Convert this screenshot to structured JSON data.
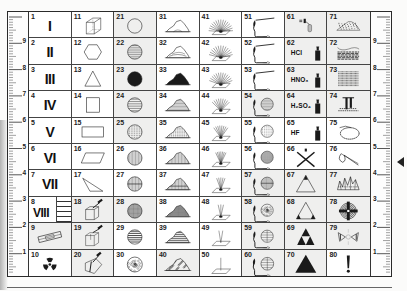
{
  "card": {
    "ruler_left_labels": [
      "9",
      "8",
      "7",
      "6",
      "5",
      "4",
      "3",
      "2",
      "1"
    ],
    "ruler_right_labels": [
      "9",
      "8",
      "7",
      "6",
      "5",
      "4",
      "3",
      "2",
      "1"
    ],
    "pointer": "triangle-pointer-left",
    "cells": [
      {
        "n": "1",
        "roman": "I",
        "icon": "roman-numeral"
      },
      {
        "n": "2",
        "roman": "II",
        "icon": "roman-numeral"
      },
      {
        "n": "3",
        "roman": "III",
        "icon": "roman-numeral"
      },
      {
        "n": "4",
        "roman": "IV",
        "icon": "roman-numeral"
      },
      {
        "n": "5",
        "roman": "V",
        "icon": "roman-numeral"
      },
      {
        "n": "6",
        "roman": "VI",
        "icon": "roman-numeral"
      },
      {
        "n": "7",
        "roman": "VII",
        "icon": "roman-numeral"
      },
      {
        "n": "8",
        "roman": "VIII",
        "icon": "roman-numeral-with-ladder"
      },
      {
        "n": "9",
        "icon": "rock-saw-icon"
      },
      {
        "n": "10",
        "icon": "radioactive-icon"
      },
      {
        "n": "11",
        "icon": "cube-icon"
      },
      {
        "n": "12",
        "icon": "hexagon-icon"
      },
      {
        "n": "13",
        "icon": "triangle-icon"
      },
      {
        "n": "14",
        "icon": "square-icon"
      },
      {
        "n": "15",
        "icon": "rectangle-icon"
      },
      {
        "n": "16",
        "icon": "parallelogram-icon"
      },
      {
        "n": "17",
        "icon": "scalene-triangle-icon"
      },
      {
        "n": "18",
        "icon": "hammer-block-icon"
      },
      {
        "n": "19",
        "icon": "hammer-box-icon"
      },
      {
        "n": "20",
        "icon": "hammer-split-icon"
      },
      {
        "n": "21",
        "icon": "circle-empty-icon"
      },
      {
        "n": "22",
        "icon": "circle-horizontal-lines-icon"
      },
      {
        "n": "23",
        "icon": "circle-filled-icon"
      },
      {
        "n": "24",
        "icon": "circle-wide-lines-icon"
      },
      {
        "n": "25",
        "icon": "circle-dashed-lines-icon"
      },
      {
        "n": "26",
        "icon": "circle-vertical-lines-icon"
      },
      {
        "n": "27",
        "icon": "circle-vertical-split-icon"
      },
      {
        "n": "28",
        "icon": "circle-crosshatch-icon"
      },
      {
        "n": "29",
        "icon": "circle-bands-icon"
      },
      {
        "n": "30",
        "icon": "circle-speckled-icon"
      },
      {
        "n": "31",
        "icon": "mound-outline-icon"
      },
      {
        "n": "32",
        "icon": "mound-layered-icon"
      },
      {
        "n": "33",
        "icon": "mound-filled-icon"
      },
      {
        "n": "34",
        "icon": "mound-hatched-icon"
      },
      {
        "n": "35",
        "icon": "mound-dashed-icon"
      },
      {
        "n": "36",
        "icon": "mound-vertical-lines-icon"
      },
      {
        "n": "37",
        "icon": "mound-split-icon"
      },
      {
        "n": "38",
        "icon": "mound-crosshatch-icon"
      },
      {
        "n": "39",
        "icon": "mound-bands-icon"
      },
      {
        "n": "40",
        "icon": "mound-speckled-icon"
      },
      {
        "n": "41",
        "icon": "fan-rays-wide-icon"
      },
      {
        "n": "42",
        "icon": "fan-rays-medium-icon"
      },
      {
        "n": "43",
        "icon": "fan-rays-dense-icon"
      },
      {
        "n": "44",
        "icon": "fan-rays-narrow-icon"
      },
      {
        "n": "45",
        "icon": "fan-rays-narrower-icon"
      },
      {
        "n": "46",
        "icon": "fan-rays-tight-icon"
      },
      {
        "n": "47",
        "icon": "fan-rays-few-icon"
      },
      {
        "n": "48",
        "icon": "fan-rays-three-icon"
      },
      {
        "n": "49",
        "icon": "fan-rays-two-icon"
      },
      {
        "n": "50",
        "icon": "single-ray-icon"
      },
      {
        "n": "51",
        "icon": "blowpipe-icon"
      },
      {
        "n": "52",
        "icon": "blowpipe-icon"
      },
      {
        "n": "53",
        "icon": "blowpipe-icon"
      },
      {
        "n": "54",
        "icon": "blowpipe-sphere-lines-icon"
      },
      {
        "n": "55",
        "icon": "blowpipe-sphere-dashed-icon"
      },
      {
        "n": "56",
        "icon": "blowpipe-sphere-crosshatch-icon"
      },
      {
        "n": "57",
        "icon": "blowpipe-sphere-split-icon"
      },
      {
        "n": "58",
        "icon": "blowpipe-sphere-speckled-icon"
      },
      {
        "n": "59",
        "icon": "blowpipe-sphere-grid-icon"
      },
      {
        "n": "60",
        "icon": "blowpipe-sphere-grid-icon"
      },
      {
        "n": "61",
        "icon": "dropper-bottle-icon"
      },
      {
        "n": "62",
        "chem": "HCl",
        "icon": "acid-bottle-icon"
      },
      {
        "n": "63",
        "chem": "HNO₃",
        "icon": "acid-bottle-icon"
      },
      {
        "n": "64",
        "chem": "H₂SO₄",
        "icon": "acid-bottle-icon"
      },
      {
        "n": "65",
        "chem": "HF",
        "icon": "acid-bottle-icon"
      },
      {
        "n": "66",
        "icon": "cross-x-icon"
      },
      {
        "n": "67",
        "icon": "triangle-top-filled-icon"
      },
      {
        "n": "68",
        "icon": "triangle-bottom-corners-icon"
      },
      {
        "n": "69",
        "icon": "triforce-icon"
      },
      {
        "n": "70",
        "icon": "triangle-filled-icon"
      },
      {
        "n": "71",
        "icon": "dotted-mound-icon"
      },
      {
        "n": "72",
        "icon": "layered-strata-icon"
      },
      {
        "n": "73",
        "icon": "banded-block-icon"
      },
      {
        "n": "74",
        "icon": "columnar-structure-icon"
      },
      {
        "n": "75",
        "icon": "loop-ring-icon"
      },
      {
        "n": "76",
        "icon": "wire-loop-icon"
      },
      {
        "n": "77",
        "icon": "crystal-cluster-icon"
      },
      {
        "n": "78",
        "icon": "crosshair-target-icon"
      },
      {
        "n": "79",
        "icon": "butterfly-twin-icon"
      },
      {
        "n": "80",
        "chem": "!",
        "icon": "exclamation-icon"
      }
    ],
    "shaded_cells": [
      "9",
      "18",
      "19",
      "20",
      "21",
      "22",
      "23",
      "24",
      "25",
      "28",
      "40",
      "54",
      "57",
      "58",
      "59",
      "60",
      "61",
      "62",
      "63",
      "64",
      "67",
      "68",
      "69",
      "70",
      "71",
      "72",
      "73",
      "74",
      "77",
      "78",
      "79"
    ]
  }
}
